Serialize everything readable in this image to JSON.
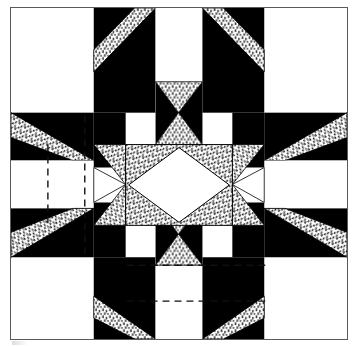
{
  "figure": {
    "title": "Pieced star quilt block diagram",
    "caption": "",
    "width": 355,
    "height": 346,
    "background": "#ffffff"
  },
  "frame": {
    "name": "block-outline",
    "x": 10,
    "y": 7,
    "width": 338,
    "height": 333,
    "stroke": "#5a5a5a",
    "stroke_width": 1
  },
  "palette": {
    "white": "#ffffff",
    "black": "#000000",
    "stipple_ink": "#1a1a1a",
    "outline": "#000000",
    "guide_line": "#111111",
    "frame": "#5a5a5a"
  },
  "grid": {
    "columns": 5,
    "rows": 5,
    "column_edges": [
      0,
      83,
      115,
      222,
      254,
      337
    ],
    "row_edges": [
      0,
      105,
      137,
      218,
      250,
      332
    ],
    "note": "Irregular 5x5 layout: wide corner squares, narrow star-point bands, large center square."
  },
  "fabrics": [
    {
      "key": "white",
      "label": "White / light fabric",
      "fill": "#ffffff"
    },
    {
      "key": "black",
      "label": "Black / dark fabric",
      "fill": "#000000"
    },
    {
      "key": "stipple",
      "label": "Stippled / print fabric",
      "fill": "stipple-pattern"
    }
  ],
  "guide_lines": {
    "style": "dashed",
    "stroke": "#111111",
    "dash": "7 5",
    "segments": [
      {
        "name": "guide-vertical-left-outer",
        "orientation": "vertical",
        "x1": 37,
        "y1": 137,
        "x2": 37,
        "y2": 218
      },
      {
        "name": "guide-vertical-left-inner",
        "orientation": "vertical",
        "x1": 74,
        "y1": 108,
        "x2": 74,
        "y2": 249
      },
      {
        "name": "guide-horizontal-bottom-upper",
        "orientation": "horizontal",
        "x1": 116,
        "y1": 258,
        "x2": 258,
        "y2": 258
      },
      {
        "name": "guide-horizontal-bottom-lower",
        "orientation": "horizontal",
        "x1": 116,
        "y1": 294,
        "x2": 258,
        "y2": 294
      }
    ]
  },
  "regions": {
    "corner_blocks": [
      {
        "name": "corner-top-left",
        "fabric": "white"
      },
      {
        "name": "corner-top-right",
        "fabric": "white"
      },
      {
        "name": "corner-bottom-left",
        "fabric": "white"
      },
      {
        "name": "corner-bottom-right",
        "fabric": "white"
      }
    ],
    "arms": [
      {
        "name": "arm-top",
        "orientation": "vertical",
        "fabrics": [
          "black",
          "stipple",
          "white"
        ]
      },
      {
        "name": "arm-bottom",
        "orientation": "vertical",
        "fabrics": [
          "black",
          "stipple",
          "white"
        ]
      },
      {
        "name": "arm-left",
        "orientation": "horizontal",
        "fabrics": [
          "black",
          "stipple",
          "white"
        ]
      },
      {
        "name": "arm-right",
        "orientation": "horizontal",
        "fabrics": [
          "black",
          "stipple",
          "white"
        ]
      }
    ],
    "hourglass_units": [
      {
        "name": "hourglass-top",
        "side_fabric": "black",
        "point_fabric": "stipple"
      },
      {
        "name": "hourglass-bottom",
        "side_fabric": "black",
        "point_fabric": "stipple"
      },
      {
        "name": "hourglass-left",
        "side_fabric": "black",
        "point_fabric": "stipple"
      },
      {
        "name": "hourglass-right",
        "side_fabric": "black",
        "point_fabric": "stipple"
      }
    ],
    "center": {
      "name": "center-square-on-point",
      "ground_fabric": "stipple",
      "diamond_fabric": "white",
      "description": "Large square-in-a-square: white diamond set on point over stippled corner triangles."
    }
  }
}
